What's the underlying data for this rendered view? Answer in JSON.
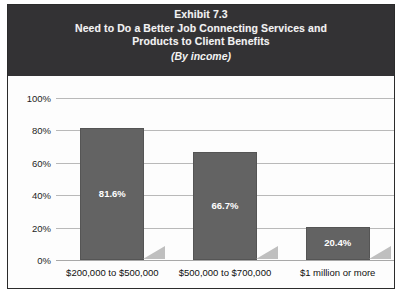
{
  "exhibit": {
    "title_lines": [
      "Exhibit 7.3",
      "Need to Do a Better Job Connecting Services and",
      "Products to Client Benefits"
    ],
    "subtitle": "(By income)"
  },
  "colors": {
    "header_background": "#333234",
    "header_text": "#f2f2f2",
    "bar_fill": "#636363",
    "bar_label": "#ffffff",
    "bar_shadow": "#bfbfbf",
    "gridline": "#b9b9b9",
    "panel_background": "#fdfdfd",
    "border": "#2b2b2b"
  },
  "chart_data": {
    "type": "bar",
    "title": "Exhibit 7.3 Need to Do a Better Job Connecting Services and Products to Client Benefits",
    "subtitle": "(By income)",
    "xlabel": "",
    "ylabel": "",
    "categories": [
      "$200,000 to $500,000",
      "$500,000 to $700,000",
      "$1 million or more"
    ],
    "values": [
      81.6,
      66.7,
      20.4
    ],
    "value_labels": [
      "81.6%",
      "66.7%",
      "20.4%"
    ],
    "ylim": [
      0,
      100
    ],
    "yticks": [
      0,
      20,
      40,
      60,
      80,
      100
    ],
    "ytick_labels": [
      "0%",
      "20%",
      "40%",
      "60%",
      "80%",
      "100%"
    ],
    "grid": true,
    "legend": false,
    "legend_position": "none"
  }
}
